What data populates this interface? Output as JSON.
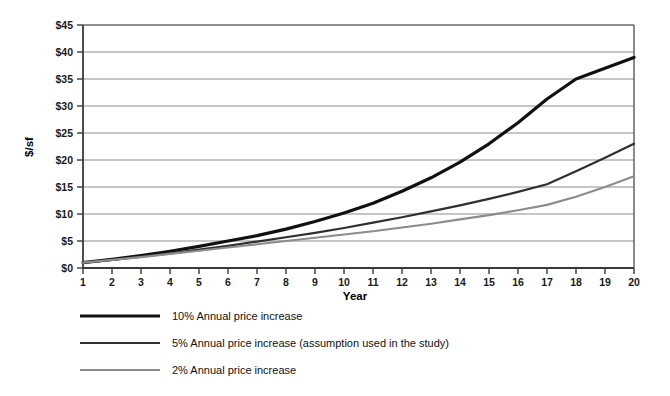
{
  "chart_data": {
    "type": "line",
    "title": "",
    "xlabel": "Year",
    "ylabel": "$/sf",
    "xlim": [
      1,
      20
    ],
    "ylim": [
      0,
      45
    ],
    "grid": "horizontal",
    "legend_position": "below",
    "x": [
      1,
      2,
      3,
      4,
      5,
      6,
      7,
      8,
      9,
      10,
      11,
      12,
      13,
      14,
      15,
      16,
      17,
      18,
      19,
      20
    ],
    "xticklabels": [
      "1",
      "2",
      "3",
      "4",
      "5",
      "6",
      "7",
      "8",
      "9",
      "10",
      "11",
      "12",
      "13",
      "14",
      "15",
      "16",
      "17",
      "18",
      "19",
      "20"
    ],
    "yticklabels": [
      "$0",
      "$5",
      "$10",
      "$15",
      "$20",
      "$25",
      "$30",
      "$35",
      "$40",
      "$45"
    ],
    "yticks": [
      0,
      5,
      10,
      15,
      20,
      25,
      30,
      35,
      40,
      45
    ],
    "series": [
      {
        "name": "10% Annual price increase",
        "color": "#111111",
        "width": 3.2,
        "values": [
          1.0,
          1.1,
          1.21,
          1.33,
          1.46,
          1.61,
          1.77,
          1.95,
          2.14,
          2.36,
          2.59,
          2.85,
          3.14,
          3.45,
          3.8,
          4.18,
          4.59,
          5.05,
          5.56,
          6.12
        ]
      },
      {
        "name": "5% Annual price increase (assumption used in the study)",
        "color": "#2f2f2f",
        "width": 2.2,
        "values": [
          1.0,
          1.05,
          1.1,
          1.16,
          1.22,
          1.28,
          1.34,
          1.41,
          1.48,
          1.55,
          1.63,
          1.71,
          1.8,
          1.89,
          1.98,
          2.08,
          2.18,
          2.29,
          2.41,
          2.53
        ]
      },
      {
        "name": "2% Annual price increase",
        "color": "#8c8c8c",
        "width": 2.2,
        "values": [
          1.0,
          1.02,
          1.04,
          1.06,
          1.08,
          1.1,
          1.13,
          1.15,
          1.17,
          1.2,
          1.22,
          1.24,
          1.27,
          1.29,
          1.32,
          1.35,
          1.37,
          1.4,
          1.43,
          1.46
        ]
      }
    ],
    "plotted_values": {
      "note": "values rendered on chart, in $/sf",
      "10pct": [
        1.0,
        1.6,
        2.3,
        3.1,
        4.0,
        5.0,
        6.0,
        7.2,
        8.6,
        10.2,
        12.0,
        14.2,
        16.7,
        19.6,
        23.0,
        26.9,
        31.3,
        35.0,
        37.0,
        39.0
      ],
      "5pct": [
        1.0,
        1.5,
        2.1,
        2.7,
        3.4,
        4.1,
        4.9,
        5.7,
        6.5,
        7.4,
        8.4,
        9.4,
        10.5,
        11.6,
        12.8,
        14.1,
        15.5,
        17.9,
        20.4,
        23.0
      ],
      "2pct": [
        1.0,
        1.5,
        2.0,
        2.6,
        3.2,
        3.8,
        4.4,
        5.0,
        5.6,
        6.2,
        6.8,
        7.5,
        8.2,
        9.0,
        9.8,
        10.7,
        11.7,
        13.2,
        15.0,
        17.0
      ]
    },
    "legend": [
      "10% Annual price increase",
      "5% Annual price increase (assumption used in the study)",
      "2% Annual price increase"
    ],
    "colors": {
      "series_10pct": "#111111",
      "series_5pct": "#2f2f2f",
      "series_2pct": "#8c8c8c",
      "gridline": "#8e8e8e",
      "axis": "#3a3a3a",
      "background": "#ffffff"
    }
  }
}
